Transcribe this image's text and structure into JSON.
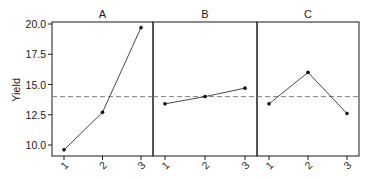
{
  "chart_data": {
    "type": "line",
    "title": "",
    "xlabel": "",
    "ylabel": "Yield",
    "ylim": [
      9.5,
      20.5
    ],
    "yticks": [
      10.0,
      12.5,
      15.0,
      17.5,
      20.0
    ],
    "ytick_labels": [
      "10.0",
      "12.5",
      "15.0",
      "17.5",
      "20.0"
    ],
    "categories": [
      "1",
      "2",
      "3"
    ],
    "grid": false,
    "reference_line": {
      "value": 14.0,
      "style": "dashed",
      "label": "grand mean"
    },
    "panels": [
      {
        "name": "A",
        "values": [
          9.6,
          12.7,
          19.7
        ]
      },
      {
        "name": "B",
        "values": [
          13.4,
          14.0,
          14.7
        ]
      },
      {
        "name": "C",
        "values": [
          13.4,
          16.0,
          12.6
        ]
      }
    ],
    "colors": {
      "line": "#333333",
      "ref": "#808080",
      "axis": "#1a1a1a"
    }
  }
}
